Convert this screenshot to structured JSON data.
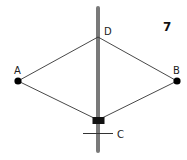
{
  "figure": {
    "number": "7",
    "points": {
      "A": {
        "label": "A"
      },
      "B": {
        "label": "B"
      },
      "C": {
        "label": "C"
      },
      "D": {
        "label": "D"
      }
    },
    "colors": {
      "rod": "#7a7a7a",
      "lines": "#333333",
      "points": "#000000"
    }
  }
}
